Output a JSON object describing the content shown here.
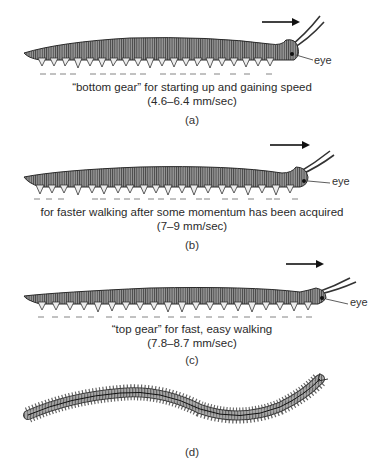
{
  "figure": {
    "panels": [
      {
        "id": "a",
        "label": "(a)",
        "caption_line1": "“bottom gear” for starting up and gaining speed",
        "caption_line2": "(4.6–6.4 mm/sec)",
        "eye_label": "eye",
        "direction": "right",
        "leg_wave_pattern": "short metachronal waves (dense groups of arrows)"
      },
      {
        "id": "b",
        "label": "(b)",
        "caption_line1": "for faster walking after some momentum has been acquired",
        "caption_line2": "(7–9 mm/sec)",
        "eye_label": "eye",
        "direction": "right",
        "leg_wave_pattern": "intermediate metachronal waves"
      },
      {
        "id": "c",
        "label": "(c)",
        "caption_line1": "“top gear” for fast, easy walking",
        "caption_line2": "(7.8–8.7 mm/sec)",
        "eye_label": "eye",
        "direction": "right",
        "leg_wave_pattern": "long metachronal waves (evenly spaced arrows)"
      },
      {
        "id": "d",
        "label": "(d)",
        "view": "dorsal view of undulating body with legs"
      }
    ],
    "colors": {
      "body_fill": "#8a8a8a",
      "body_dark": "#3a3a3a",
      "leg_fill": "#e8e8e8",
      "arrow": "#555555",
      "text": "#2a2a2a"
    }
  }
}
